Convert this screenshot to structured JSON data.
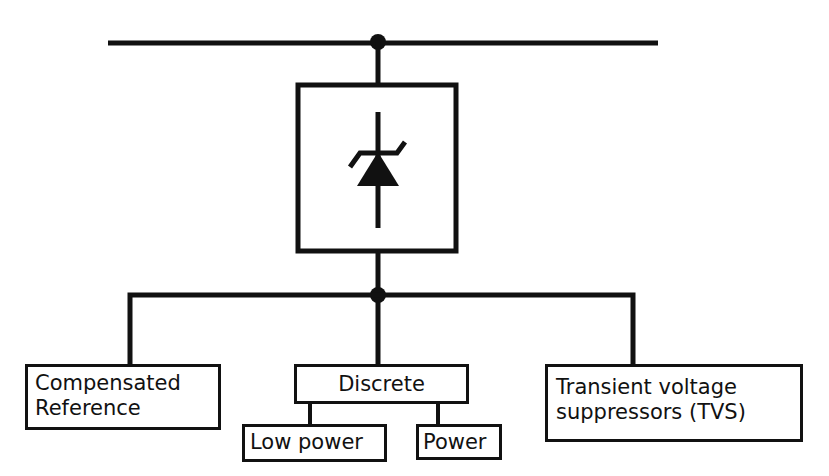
{
  "diagram": {
    "type": "tree",
    "root": {
      "symbol": "zener-diode-icon",
      "description": "Zener diode symbol in a square box connected to a bus line"
    },
    "categories": [
      {
        "label_line1": "Compensated",
        "label_line2": "Reference"
      },
      {
        "label": "Discrete",
        "children": [
          {
            "label": "Low power"
          },
          {
            "label": "Power"
          }
        ]
      },
      {
        "label_line1": "Transient voltage",
        "label_line2": "suppressors (TVS)"
      }
    ],
    "colors": {
      "line": "#111111",
      "background": "#ffffff"
    }
  }
}
